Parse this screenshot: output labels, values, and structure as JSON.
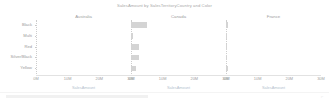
{
  "chart_data": {
    "type": "bar",
    "orientation": "horizontal",
    "title": "SalesAmount by SalesTerritoryCountry and Color",
    "xlabel": "SalesAmount",
    "ylabel": "",
    "xlim": [
      0,
      30000000
    ],
    "xticks": [
      0,
      10000000,
      20000000,
      30000000
    ],
    "xtick_labels": [
      "0M",
      "10M",
      "20M",
      "30M"
    ],
    "categories": [
      "Black",
      "Multi",
      "Red",
      "Silver/Black",
      "Yellow"
    ],
    "facet_by": "SalesTerritoryCountry",
    "facets": [
      "Australia",
      "Canada",
      "France"
    ],
    "legend": "none",
    "grid": false,
    "bar_color": "#d4d4d4",
    "series": [
      {
        "name": "Australia",
        "values": [
          0,
          0,
          0,
          0,
          0
        ]
      },
      {
        "name": "Canada",
        "values": [
          5200000,
          500000,
          2400000,
          2400000,
          1500000
        ]
      },
      {
        "name": "France",
        "values": [
          700000,
          400000,
          300000,
          300000,
          700000
        ]
      }
    ]
  },
  "chart": {
    "title": "SalesAmount by SalesTerritoryCountry and Color",
    "panels": [
      {
        "header": "Australia",
        "axis_title": "SalesAmount"
      },
      {
        "header": "Canada",
        "axis_title": "SalesAmount"
      },
      {
        "header": "France",
        "axis_title": "SalesAmount"
      }
    ],
    "y_categories": [
      "Black",
      "Multi",
      "Red",
      "Silver/Black",
      "Yellow"
    ],
    "x_tick_labels": [
      "0M",
      "10M",
      "20M",
      "30M"
    ],
    "colors": {
      "bar": "#d4d4d4",
      "axis_title": "#b4bfce",
      "text": "#9a9a9a",
      "background": "#ffffff"
    }
  }
}
